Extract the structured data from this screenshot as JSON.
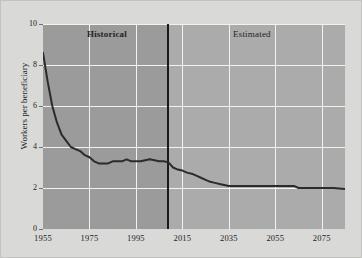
{
  "chart_data": {
    "type": "line",
    "title": "",
    "xlabel": "",
    "ylabel": "Workers per beneficiary",
    "xlim": [
      1955,
      2085
    ],
    "ylim": [
      0,
      10
    ],
    "grid": true,
    "legend": "none",
    "x_ticks": [
      "1955",
      "1975",
      "1995",
      "2015",
      "2035",
      "2055",
      "2075"
    ],
    "y_ticks": [
      "0",
      "2",
      "4",
      "6",
      "8",
      "10"
    ],
    "annotations": [
      {
        "name": "historical",
        "label": "Historical",
        "x_range": [
          1955,
          2009
        ]
      },
      {
        "name": "estimated",
        "label": "Estimated",
        "x_range": [
          2009,
          2085
        ]
      }
    ],
    "divider_year": 2009,
    "series": [
      {
        "name": "Workers per beneficiary",
        "color": "#2b2b2b",
        "x": [
          1955,
          1957,
          1959,
          1961,
          1963,
          1965,
          1967,
          1969,
          1971,
          1973,
          1975,
          1977,
          1979,
          1981,
          1983,
          1985,
          1987,
          1989,
          1991,
          1993,
          1995,
          1997,
          1999,
          2001,
          2003,
          2005,
          2007,
          2009,
          2011,
          2013,
          2015,
          2017,
          2019,
          2021,
          2023,
          2025,
          2027,
          2029,
          2031,
          2033,
          2035,
          2040,
          2045,
          2050,
          2055,
          2060,
          2063,
          2065,
          2070,
          2075,
          2080,
          2085
        ],
        "y": [
          8.6,
          7.2,
          6.0,
          5.2,
          4.6,
          4.3,
          4.0,
          3.9,
          3.8,
          3.6,
          3.5,
          3.3,
          3.2,
          3.2,
          3.2,
          3.3,
          3.3,
          3.3,
          3.4,
          3.3,
          3.3,
          3.3,
          3.35,
          3.4,
          3.35,
          3.3,
          3.3,
          3.25,
          3.0,
          2.9,
          2.85,
          2.75,
          2.7,
          2.6,
          2.5,
          2.4,
          2.3,
          2.25,
          2.2,
          2.15,
          2.1,
          2.1,
          2.1,
          2.1,
          2.1,
          2.1,
          2.1,
          2.0,
          2.0,
          2.0,
          2.0,
          1.95
        ]
      }
    ]
  },
  "colors": {
    "historical_band": "#9b9b9b",
    "estimated_band": "#ababab",
    "gridline": "#f2f2ef",
    "series": "#2b2b2b",
    "divider": "#1a1a1a",
    "figure_background": "#d9d9d7"
  }
}
